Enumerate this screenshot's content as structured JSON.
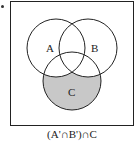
{
  "diagram": {
    "type": "venn",
    "sets": [
      {
        "label": "A",
        "cx": 56,
        "cy": 48,
        "r": 29
      },
      {
        "label": "B",
        "cx": 88,
        "cy": 48,
        "r": 29
      },
      {
        "label": "C",
        "cx": 72,
        "cy": 81,
        "r": 29
      }
    ],
    "shaded_region": "C minus (A union B)",
    "shade_color": "#c8c8c8",
    "stroke_color": "#222222",
    "caption": "(A'∩B')∩C",
    "labels": {
      "a": "A",
      "b": "B",
      "c": "C"
    }
  }
}
